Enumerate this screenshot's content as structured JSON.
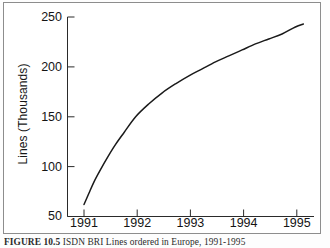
{
  "figure": {
    "caption_number": "FIGURE 10.5",
    "caption_text": "ISDN BRI Lines ordered in Europe, 1991-1995"
  },
  "chart_data": {
    "type": "line",
    "title": "",
    "subtitle": "",
    "xlabel": "",
    "ylabel": "Lines (Thousands)",
    "x_tick_labels": [
      "1991",
      "1992",
      "1993",
      "1994",
      "1995"
    ],
    "x_ticks": [
      1991,
      1992,
      1993,
      1994,
      1995
    ],
    "y_tick_labels": [
      "50",
      "100",
      "150",
      "200",
      "250"
    ],
    "y_ticks": [
      50,
      100,
      150,
      200,
      250
    ],
    "xlim": [
      1990.72,
      1995.35
    ],
    "ylim": [
      50,
      250
    ],
    "grid": false,
    "legend": false,
    "legend_position": "none",
    "series": [
      {
        "name": "ISDN BRI Lines ordered in Europe",
        "color": "#1a1a1a",
        "x": [
          1991.03,
          1991.12,
          1991.22,
          1991.34,
          1991.48,
          1991.62,
          1991.78,
          1992.0,
          1992.25,
          1992.5,
          1992.75,
          1993.0,
          1993.25,
          1993.5,
          1993.75,
          1994.0,
          1994.25,
          1994.5,
          1994.75,
          1995.0,
          1995.15
        ],
        "y": [
          62,
          73,
          85,
          97,
          110,
          122,
          134,
          150,
          163,
          174,
          183,
          191,
          198,
          205,
          211,
          217,
          223,
          228,
          233,
          240,
          243
        ]
      }
    ],
    "annotations": []
  },
  "axes": {
    "y_axis_title": "Lines (Thousands)",
    "tick_direction": "in",
    "spines": [
      "left",
      "bottom"
    ]
  },
  "colors": {
    "line": "#1a1a1a",
    "axis": "#2a2a2a",
    "border": "#8d8d8d",
    "background": "#ffffff",
    "text": "#141414"
  }
}
